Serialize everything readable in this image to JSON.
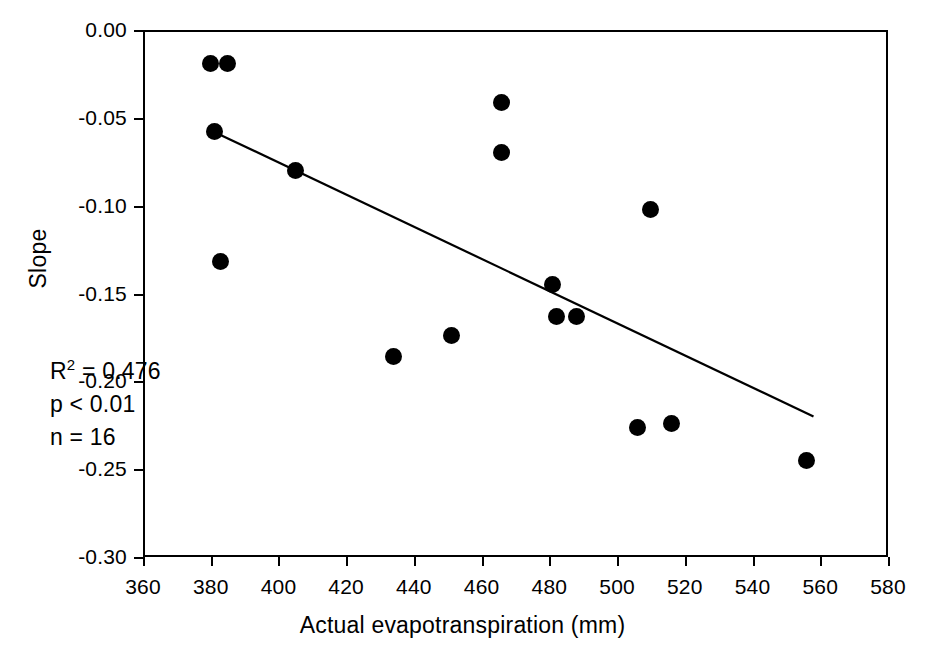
{
  "chart_data": {
    "type": "scatter",
    "title": "",
    "xlabel": "Actual evapotranspiration (mm)",
    "ylabel": "Slope",
    "xlim": [
      360,
      580
    ],
    "ylim": [
      -0.3,
      0.0
    ],
    "xticks": [
      360,
      380,
      400,
      420,
      440,
      460,
      480,
      500,
      520,
      540,
      560,
      580
    ],
    "xtick_labels": [
      "360",
      "380",
      "400",
      "420",
      "440",
      "460",
      "480",
      "500",
      "520",
      "540",
      "560",
      "580"
    ],
    "yticks": [
      0.0,
      -0.05,
      -0.1,
      -0.15,
      -0.2,
      -0.25,
      -0.3
    ],
    "ytick_labels": [
      "0.00",
      "-0.05",
      "-0.10",
      "-0.15",
      "-0.20",
      "-0.25",
      "-0.30"
    ],
    "grid": false,
    "legend": null,
    "marker_color": "#000000",
    "line_color": "#000000",
    "points": [
      {
        "x": 380,
        "y": -0.019
      },
      {
        "x": 385,
        "y": -0.019
      },
      {
        "x": 381,
        "y": -0.058
      },
      {
        "x": 383,
        "y": -0.132
      },
      {
        "x": 405,
        "y": -0.08
      },
      {
        "x": 434,
        "y": -0.186
      },
      {
        "x": 451,
        "y": -0.174
      },
      {
        "x": 466,
        "y": -0.041
      },
      {
        "x": 466,
        "y": -0.07
      },
      {
        "x": 481,
        "y": -0.145
      },
      {
        "x": 482,
        "y": -0.163
      },
      {
        "x": 488,
        "y": -0.163
      },
      {
        "x": 510,
        "y": -0.102
      },
      {
        "x": 506,
        "y": -0.226
      },
      {
        "x": 516,
        "y": -0.224
      },
      {
        "x": 556,
        "y": -0.245
      }
    ],
    "fit_line": {
      "x_start": 381,
      "y_start": -0.058,
      "x_end": 558,
      "y_end": -0.22
    },
    "annotations": {
      "r_squared_prefix": "R",
      "r_squared_exponent": "2",
      "r_squared_value": " = 0.476",
      "p_value": "p < 0.01",
      "n_value": "n = 16"
    }
  }
}
